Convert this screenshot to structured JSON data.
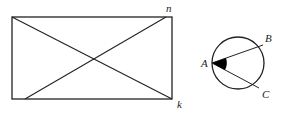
{
  "figure": {
    "rectangle": {
      "corner_labels": {
        "top_right": "n",
        "bottom_right": "k"
      },
      "stroke": "#222222"
    },
    "circle": {
      "point_labels": {
        "vertex": "A",
        "upper": "B",
        "lower": "C"
      },
      "angle_fill": "#000000",
      "stroke": "#222222"
    }
  }
}
